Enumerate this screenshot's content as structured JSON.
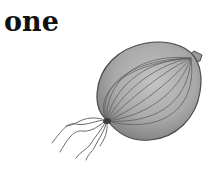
{
  "card": {
    "word": "one",
    "illustration": {
      "subject": "onion",
      "count": 1,
      "style": "grayscale pencil sketch"
    }
  },
  "colors": {
    "background": "#ffffff",
    "text": "#111111",
    "onion_fill": "#a9a9a9",
    "onion_stroke": "#4a4a4a",
    "onion_highlight": "#c4c4c4"
  }
}
